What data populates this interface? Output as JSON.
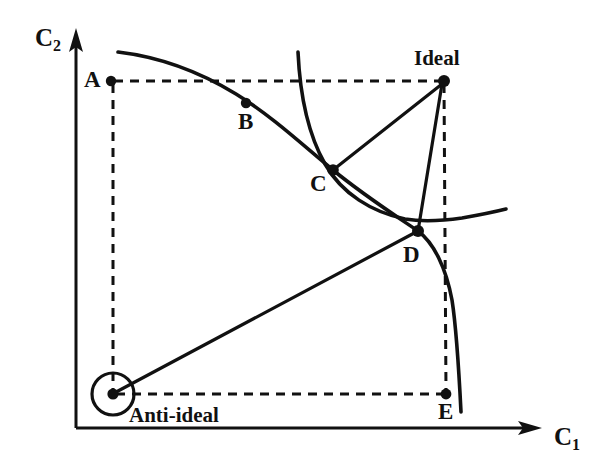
{
  "figure": {
    "type": "multi-objective-optimization-diagram",
    "background_color": "#ffffff",
    "ink_color": "#111111"
  },
  "axes": {
    "y_axis": {
      "label": "C",
      "subscript": "2"
    },
    "x_axis": {
      "label": "C",
      "subscript": "1"
    }
  },
  "points": {
    "a": {
      "label": "A",
      "x": 111,
      "y": 81
    },
    "b": {
      "label": "B",
      "x": 246,
      "y": 103
    },
    "c": {
      "label": "C",
      "x": 333,
      "y": 170
    },
    "d": {
      "label": "D",
      "x": 418,
      "y": 231
    },
    "e": {
      "label": "E",
      "x": 446,
      "y": 394
    },
    "ideal": {
      "label": "Ideal",
      "x": 444,
      "y": 81
    },
    "anti_ideal": {
      "label": "Anti-ideal",
      "x": 113,
      "y": 394
    }
  },
  "curves": {
    "pareto_front": {
      "name": "pareto-front-curve"
    },
    "indifference": {
      "name": "indifference-curve"
    }
  },
  "connectors": {
    "anti_ideal_to_d_to_ideal": {
      "name": "anti-ideal-to-ideal-ray"
    },
    "c_to_ideal": {
      "name": "c-to-ideal-ray"
    },
    "a_to_ideal_dashed": {
      "name": "a-to-ideal-guide"
    },
    "a_to_anti_ideal_dashed": {
      "name": "a-to-anti-ideal-guide"
    },
    "ideal_to_e_dashed": {
      "name": "ideal-to-e-guide"
    },
    "anti_ideal_to_e_dashed": {
      "name": "anti-ideal-to-e-guide"
    }
  }
}
